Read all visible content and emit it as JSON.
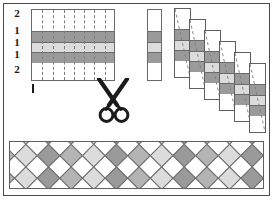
{
  "figure": {
    "background": "#fefefe",
    "frame_color": "#4a4a4a"
  },
  "palette": {
    "white": "#ffffff",
    "light_gray": "#dcdcdc",
    "mid_gray": "#b4b4b4",
    "dark_gray": "#9a9a9a",
    "outline": "#6a6a6a",
    "dash": "#7d7d7d",
    "ink": "#1b1b1b"
  },
  "row_labels": [
    {
      "text": "2",
      "top": 0
    },
    {
      "text": "1",
      "top": 17
    },
    {
      "text": "1",
      "top": 29
    },
    {
      "text": "1",
      "top": 41
    },
    {
      "text": "2",
      "top": 56
    }
  ],
  "grid": {
    "name": "striped source sheet",
    "width": 84,
    "height": 72,
    "bands": [
      {
        "top": 0,
        "height": 21,
        "fill": "#ffffff"
      },
      {
        "top": 21,
        "height": 11,
        "fill": "#9a9a9a"
      },
      {
        "top": 32,
        "height": 10,
        "fill": "#dcdcdc"
      },
      {
        "top": 42,
        "height": 11,
        "fill": "#9a9a9a"
      },
      {
        "top": 53,
        "height": 19,
        "fill": "#ffffff"
      }
    ],
    "cut_lines": [
      10,
      21,
      32,
      42,
      52,
      62,
      73
    ],
    "cut_line_style": "dashed"
  },
  "scissors": {
    "icon": "scissors-icon",
    "caption": "cut along dashed lines",
    "color": "#1b1b1b"
  },
  "single_strip": {
    "name": "one cut strip",
    "bands": [
      {
        "top": 0,
        "height": 21,
        "fill": "#ffffff"
      },
      {
        "top": 21,
        "height": 11,
        "fill": "#9a9a9a"
      },
      {
        "top": 32,
        "height": 10,
        "fill": "#dcdcdc"
      },
      {
        "top": 42,
        "height": 11,
        "fill": "#9a9a9a"
      },
      {
        "top": 53,
        "height": 19,
        "fill": "#ffffff"
      }
    ]
  },
  "cascade": {
    "name": "strips offset in a staircase",
    "count": 6,
    "step_x": 15,
    "step_y": 11,
    "strips": [
      {
        "left": 0,
        "top": 0,
        "bands": [
          {
            "top": 0,
            "height": 20,
            "fill": "#ffffff"
          },
          {
            "top": 20,
            "height": 11,
            "fill": "#9a9a9a"
          },
          {
            "top": 31,
            "height": 10,
            "fill": "#dcdcdc"
          },
          {
            "top": 41,
            "height": 11,
            "fill": "#9a9a9a"
          },
          {
            "top": 52,
            "height": 18,
            "fill": "#ffffff"
          }
        ]
      },
      {
        "left": 15,
        "top": 11,
        "bands": [
          {
            "top": 0,
            "height": 20,
            "fill": "#ffffff"
          },
          {
            "top": 20,
            "height": 11,
            "fill": "#9a9a9a"
          },
          {
            "top": 31,
            "height": 10,
            "fill": "#dcdcdc"
          },
          {
            "top": 41,
            "height": 11,
            "fill": "#9a9a9a"
          },
          {
            "top": 52,
            "height": 18,
            "fill": "#ffffff"
          }
        ]
      },
      {
        "left": 30,
        "top": 22,
        "bands": [
          {
            "top": 0,
            "height": 20,
            "fill": "#ffffff"
          },
          {
            "top": 20,
            "height": 11,
            "fill": "#9a9a9a"
          },
          {
            "top": 31,
            "height": 10,
            "fill": "#dcdcdc"
          },
          {
            "top": 41,
            "height": 11,
            "fill": "#9a9a9a"
          },
          {
            "top": 52,
            "height": 18,
            "fill": "#ffffff"
          }
        ]
      },
      {
        "left": 45,
        "top": 33,
        "bands": [
          {
            "top": 0,
            "height": 20,
            "fill": "#ffffff"
          },
          {
            "top": 20,
            "height": 11,
            "fill": "#9a9a9a"
          },
          {
            "top": 31,
            "height": 10,
            "fill": "#dcdcdc"
          },
          {
            "top": 41,
            "height": 11,
            "fill": "#9a9a9a"
          },
          {
            "top": 52,
            "height": 18,
            "fill": "#ffffff"
          }
        ]
      },
      {
        "left": 60,
        "top": 44,
        "bands": [
          {
            "top": 0,
            "height": 20,
            "fill": "#ffffff"
          },
          {
            "top": 20,
            "height": 11,
            "fill": "#9a9a9a"
          },
          {
            "top": 31,
            "height": 10,
            "fill": "#dcdcdc"
          },
          {
            "top": 41,
            "height": 11,
            "fill": "#9a9a9a"
          },
          {
            "top": 52,
            "height": 18,
            "fill": "#ffffff"
          }
        ]
      },
      {
        "left": 75,
        "top": 55,
        "bands": [
          {
            "top": 0,
            "height": 20,
            "fill": "#ffffff"
          },
          {
            "top": 20,
            "height": 11,
            "fill": "#9a9a9a"
          },
          {
            "top": 31,
            "height": 10,
            "fill": "#dcdcdc"
          },
          {
            "top": 41,
            "height": 11,
            "fill": "#9a9a9a"
          },
          {
            "top": 52,
            "height": 18,
            "fill": "#ffffff"
          }
        ]
      }
    ]
  },
  "braid": {
    "name": "finished woven diamond braid",
    "tile": 16,
    "rows": 4,
    "cols": 18,
    "tile_colors": [
      "#ffffff",
      "#dcdcdc",
      "#b4b4b4",
      "#9a9a9a"
    ],
    "outline": "#6f6f6f"
  }
}
